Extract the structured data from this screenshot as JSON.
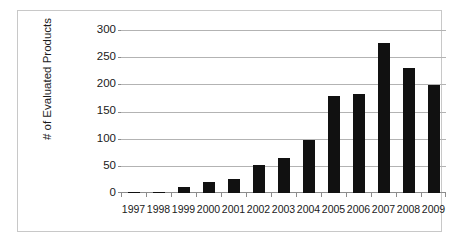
{
  "chart_data": {
    "type": "bar",
    "title": "",
    "xlabel": "",
    "ylabel": "# of Evaluated Products",
    "categories": [
      "1997",
      "1998",
      "1999",
      "2000",
      "2001",
      "2002",
      "2003",
      "2004",
      "2005",
      "2006",
      "2007",
      "2008",
      "2009"
    ],
    "values": [
      1,
      2,
      11,
      21,
      25,
      51,
      64,
      98,
      178,
      182,
      276,
      230,
      198
    ],
    "ylim": [
      0,
      300
    ],
    "yticks": [
      0,
      50,
      100,
      150,
      200,
      250,
      300
    ],
    "ytick_labels": [
      "0",
      "50",
      "100",
      "150",
      "200",
      "250",
      "300"
    ],
    "grid": true,
    "legend": false,
    "bar_color": "#111111",
    "gridline_color": "#b3b3b3",
    "axis_color": "#8c8c8c",
    "frame_color": "#c8c8c8",
    "background_color": "#ffffff"
  }
}
